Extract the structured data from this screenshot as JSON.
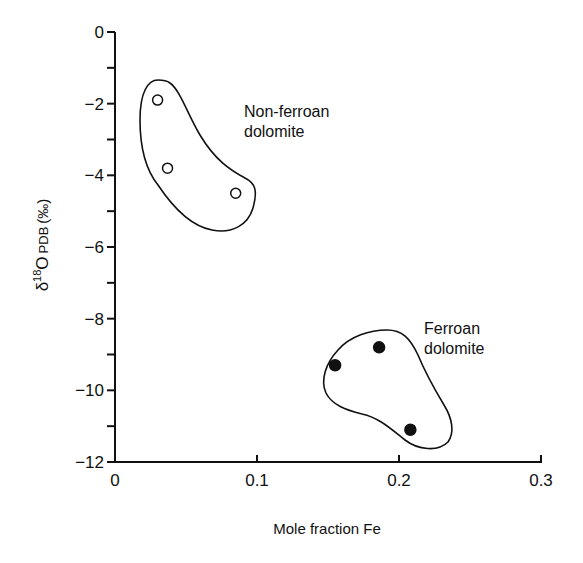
{
  "chart_data": {
    "type": "scatter",
    "title": "",
    "xlabel": "Mole fraction Fe",
    "ylabel": "δ18O PDB (‰)",
    "ylabel_parts": {
      "delta": "δ",
      "sup": "18",
      "element": "O",
      "sub": "PDB",
      "unit": "(‰)"
    },
    "xlim": [
      0,
      0.3
    ],
    "ylim": [
      -12,
      0
    ],
    "xticks": [
      0,
      0.1,
      0.2,
      0.3
    ],
    "xtick_labels": [
      "0",
      "0.1",
      "0.2",
      "0.3"
    ],
    "yticks_major": [
      0,
      -2,
      -4,
      -6,
      -8,
      -10,
      -12
    ],
    "ytick_labels": [
      "0",
      "−2",
      "−4",
      "−6",
      "−8",
      "−10",
      "−12"
    ],
    "yticks_minor": [
      -1,
      -3,
      -5,
      -7,
      -9,
      -11
    ],
    "grid": false,
    "legend": null,
    "series": [
      {
        "name": "Non-ferroan dolomite",
        "marker": "open-circle",
        "points": [
          {
            "x": 0.03,
            "y": -1.9
          },
          {
            "x": 0.037,
            "y": -3.8
          },
          {
            "x": 0.085,
            "y": -4.5
          }
        ]
      },
      {
        "name": "Ferroan dolomite",
        "marker": "filled-circle",
        "points": [
          {
            "x": 0.155,
            "y": -9.3
          },
          {
            "x": 0.186,
            "y": -8.8
          },
          {
            "x": 0.208,
            "y": -11.1
          }
        ]
      }
    ],
    "annotations": [
      {
        "text_lines": [
          "Non-ferroan",
          "dolomite"
        ],
        "x": 0.092,
        "y": -2.0
      },
      {
        "text_lines": [
          "Ferroan",
          "dolomite"
        ],
        "x": 0.218,
        "y": -8.5
      }
    ],
    "enclosures": [
      {
        "group": "Non-ferroan dolomite",
        "shape": "hand-drawn outline"
      },
      {
        "group": "Ferroan dolomite",
        "shape": "hand-drawn outline"
      }
    ]
  }
}
